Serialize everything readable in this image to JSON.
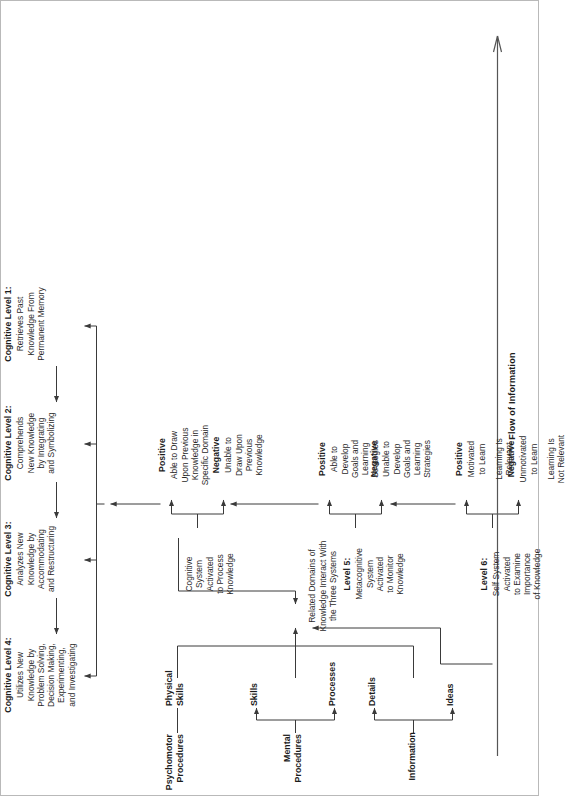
{
  "diagram": {
    "flow_label": "Flow of Information",
    "knowledge_domains": {
      "information": {
        "label": "Information",
        "children": [
          "Details",
          "Ideas"
        ]
      },
      "mental_procedures": {
        "label": "Mental\nProcedures",
        "line1": "Mental",
        "line2": "Procedures",
        "children": [
          "Skills",
          "Processes"
        ]
      },
      "psychomotor_procedures": {
        "line1": "Psychomotor",
        "line2": "Procedures",
        "children_line1": "Physical",
        "children_line2": "Skills"
      }
    },
    "hub": {
      "line1": "Related Domains of",
      "line2": "Knowledge Interact With",
      "line3": "the Three Systems"
    },
    "levels": [
      {
        "id": "level-6",
        "title": "Level 6:",
        "body": "Self System\nActivated\nto Examine\nImportance\nof Knowledge",
        "body_lines": [
          "Self System",
          "Activated",
          "to Examine",
          "Importance",
          "of Knowledge"
        ],
        "negative": {
          "label": "Negative",
          "lines": [
            "Unmotivated",
            "to Learn",
            "",
            "Learning Is",
            "Not Relevant"
          ]
        },
        "positive": {
          "label": "Positive",
          "lines": [
            "Motivated",
            "to Learn",
            "",
            "Learning Is",
            "Relevant"
          ]
        }
      },
      {
        "id": "level-5",
        "title": "Level 5:",
        "body_lines": [
          "Metacognitive",
          "System",
          "Activated",
          "to Monitor",
          "Knowledge"
        ],
        "negative": {
          "label": "Negative",
          "lines": [
            "Unable to",
            "Develop",
            "Goals and",
            "Learning",
            "Strategies"
          ]
        },
        "positive": {
          "label": "Positive",
          "lines": [
            "Able to",
            "Develop",
            "Goals and",
            "Learning",
            "Strategies"
          ]
        }
      },
      {
        "id": "cognitive-system",
        "title": "",
        "body_lines": [
          "Cognitive",
          "System",
          "Activated",
          "to Process",
          "Knowledge"
        ],
        "negative": {
          "label": "Negative",
          "lines": [
            "Unable to",
            "Draw Upon",
            "Previous",
            "Knowledge"
          ]
        },
        "positive": {
          "label": "Positive",
          "lines": [
            "Able to Draw",
            "Upon Previous",
            "Knowledge in",
            "Specific Domain"
          ]
        }
      }
    ],
    "cognitive_levels": [
      {
        "id": "cognitive-level-1",
        "title": "Cognitive Level 1:",
        "body_lines": [
          "Retrieves Past",
          "Knowledge From",
          "Permanent Memory"
        ]
      },
      {
        "id": "cognitive-level-2",
        "title": "Cognitive Level 2:",
        "body_lines": [
          "Comprehends",
          "New Knowledge",
          "by Integrating",
          "and Symbolizing"
        ]
      },
      {
        "id": "cognitive-level-3",
        "title": "Cognitive Level 3:",
        "body_lines": [
          "Analyzes New",
          "Knowledge by",
          "Accommodating",
          "and Restructuring"
        ]
      },
      {
        "id": "cognitive-level-4",
        "title": "Cognitive Level 4:",
        "body_lines": [
          "Utilizes New",
          "Knowledge by",
          "Problem Solving,",
          "Decision Making,",
          "Experimenting,",
          "and Investigating"
        ]
      }
    ],
    "colors": {
      "stroke": "#3a3a3a",
      "text": "#1c1c1c",
      "body_text": "#2a2a2a",
      "frame": "#b9b9b9"
    }
  }
}
